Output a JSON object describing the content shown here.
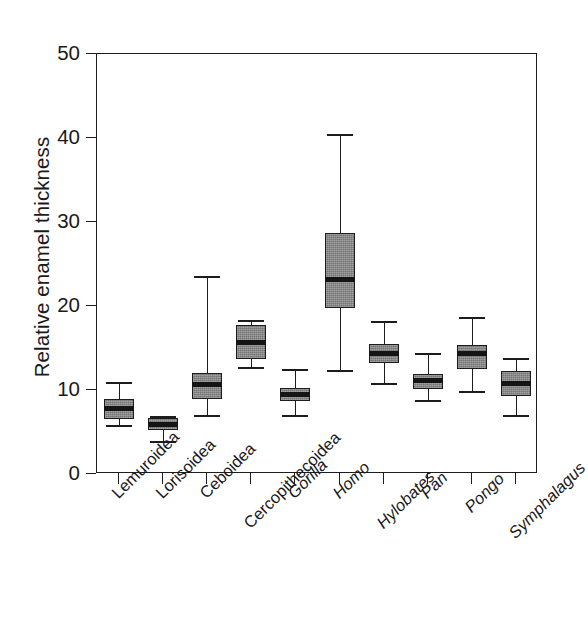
{
  "chart_data": {
    "type": "box",
    "title": "",
    "xlabel": "",
    "ylabel": "Relative enamel thickness",
    "ylim": [
      0,
      50
    ],
    "yticks": [
      0,
      10,
      20,
      30,
      40,
      50
    ],
    "ytick_labels": [
      "0",
      "10",
      "20",
      "30",
      "40",
      "50"
    ],
    "grid": false,
    "legend": "none",
    "box_fill_color": "#838383",
    "line_color": "#1c1c1c",
    "background_color": "#ffffff",
    "categories": [
      "Lemuroidea",
      "Lorisoidea",
      "Ceboidea",
      "Cercopithecoidea",
      "Gorilla",
      "Homo",
      "Hylobates",
      "Pan",
      "Pongo",
      "Symphalagus"
    ],
    "category_styles": [
      "normal",
      "normal",
      "normal",
      "normal",
      "italic",
      "italic",
      "italic",
      "italic",
      "italic",
      "italic"
    ],
    "boxes": [
      {
        "category": "Lemuroidea",
        "whisker_low": 5.8,
        "q1": 6.6,
        "median": 7.8,
        "q3": 8.9,
        "whisker_high": 10.9
      },
      {
        "category": "Lorisoidea",
        "whisker_low": 3.9,
        "q1": 5.2,
        "median": 5.9,
        "q3": 6.7,
        "whisker_high": 6.9
      },
      {
        "category": "Ceboidea",
        "whisker_low": 7.0,
        "q1": 8.9,
        "median": 10.7,
        "q3": 12.0,
        "whisker_high": 23.6
      },
      {
        "category": "Cercopithecoidea",
        "whisker_low": 12.7,
        "q1": 13.7,
        "median": 15.6,
        "q3": 17.7,
        "whisker_high": 18.3
      },
      {
        "category": "Gorilla",
        "whisker_low": 7.0,
        "q1": 8.7,
        "median": 9.5,
        "q3": 10.2,
        "whisker_high": 12.5
      },
      {
        "category": "Homo",
        "whisker_low": 12.4,
        "q1": 19.8,
        "median": 23.2,
        "q3": 28.7,
        "whisker_high": 40.5
      },
      {
        "category": "Hylobates",
        "whisker_low": 10.8,
        "q1": 13.2,
        "median": 14.4,
        "q3": 15.5,
        "whisker_high": 18.2
      },
      {
        "category": "Pan",
        "whisker_low": 8.8,
        "q1": 10.1,
        "median": 11.1,
        "q3": 11.9,
        "whisker_high": 14.4
      },
      {
        "category": "Pongo",
        "whisker_low": 9.9,
        "q1": 12.5,
        "median": 14.4,
        "q3": 15.4,
        "whisker_high": 18.7
      },
      {
        "category": "Symphalagus",
        "whisker_low": 7.0,
        "q1": 9.3,
        "median": 10.8,
        "q3": 12.3,
        "whisker_high": 13.8
      }
    ]
  }
}
